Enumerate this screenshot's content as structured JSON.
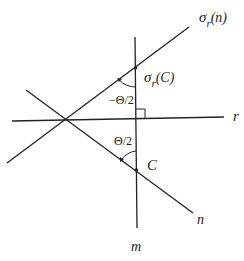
{
  "diagram": {
    "type": "geometry-reflection",
    "lines": [
      {
        "id": "r",
        "label": "r"
      },
      {
        "id": "m",
        "label": "m"
      },
      {
        "id": "n",
        "label": "n"
      },
      {
        "id": "sigma_r_n",
        "label_main": "σ",
        "label_sub": "r",
        "label_arg": "(n)"
      }
    ],
    "points": [
      {
        "id": "C",
        "label": "C"
      },
      {
        "id": "sigma_r_C",
        "label_main": "σ",
        "label_sub": "r",
        "label_arg": "(C)"
      }
    ],
    "angles": [
      {
        "id": "upper",
        "label": "−Θ/2"
      },
      {
        "id": "lower",
        "label": "Θ/2"
      }
    ],
    "right_angle_marker": true,
    "colors": {
      "line": "#222222",
      "background": "#ffffff"
    }
  }
}
